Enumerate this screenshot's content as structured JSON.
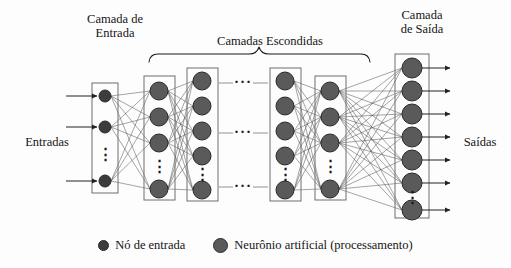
{
  "diagram": {
    "titles": {
      "input_layer": "Camada de\nEntrada",
      "hidden_layers": "Camadas Escondidas",
      "output_layer": "Camada\nde Saída"
    },
    "side_labels": {
      "inputs": "Entradas",
      "outputs": "Saídas"
    },
    "legend": [
      {
        "marker": "small-dark-circle",
        "label": "Nó de entrada"
      },
      {
        "marker": "large-gray-circle",
        "label": "Neurônio artificial (processamento)"
      }
    ],
    "colors": {
      "input_node_fill": "#3c3c3c",
      "neuron_fill": "#5a5a5a",
      "node_stroke": "#2a2a2a",
      "connection": "#4a4a4a",
      "box_stroke": "#6e6e6e",
      "arrow": "#222222",
      "background": "#fdfdfd"
    },
    "ellipsis_glyph": "⋮",
    "horizontal_ellipsis_glyph": "···",
    "layers": [
      {
        "name": "input-layer",
        "kind": "input",
        "x": 105,
        "box": {
          "x": 92,
          "y": 83,
          "w": 26,
          "h": 110
        },
        "node_radius": 6,
        "nodes_y": [
          96,
          127,
          181
        ],
        "ellipsis_y": 154
      },
      {
        "name": "hidden-layer-1",
        "kind": "hidden",
        "x": 159,
        "box": {
          "x": 144,
          "y": 76,
          "w": 31,
          "h": 124
        },
        "node_radius": 9,
        "nodes_y": [
          91,
          117,
          143,
          189
        ],
        "ellipsis_y": 166
      },
      {
        "name": "hidden-layer-2",
        "kind": "hidden",
        "x": 202,
        "box": {
          "x": 187,
          "y": 68,
          "w": 31,
          "h": 133
        },
        "node_radius": 9,
        "nodes_y": [
          81,
          106,
          131,
          156,
          190
        ],
        "ellipsis_y": 174
      },
      {
        "name": "hidden-layer-3",
        "kind": "hidden",
        "x": 285,
        "box": {
          "x": 270,
          "y": 68,
          "w": 31,
          "h": 133
        },
        "node_radius": 9,
        "nodes_y": [
          81,
          106,
          131,
          156,
          190
        ],
        "ellipsis_y": 174
      },
      {
        "name": "hidden-layer-4",
        "kind": "hidden",
        "x": 330,
        "box": {
          "x": 315,
          "y": 76,
          "w": 31,
          "h": 124
        },
        "node_radius": 9,
        "nodes_y": [
          91,
          117,
          143,
          189
        ],
        "ellipsis_y": 166
      },
      {
        "name": "output-layer",
        "kind": "output",
        "x": 412,
        "box": {
          "x": 395,
          "y": 54,
          "w": 34,
          "h": 164
        },
        "node_radius": 10,
        "nodes_y": [
          68,
          91,
          114,
          137,
          160,
          183,
          210
        ],
        "ellipsis_y": 197
      }
    ],
    "input_arrows_y": [
      96,
      127,
      181
    ],
    "output_arrows_y": [
      68,
      91,
      114,
      137,
      160,
      183,
      210
    ],
    "inter_layer_ellipses_y": [
      83,
      133,
      187
    ],
    "inter_layer_ellipsis_x": 243,
    "brace": {
      "x1": 149,
      "x2": 370,
      "y": 52,
      "peak_x": 259
    }
  }
}
